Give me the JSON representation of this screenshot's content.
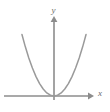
{
  "figure": {
    "name": "parabola-graph",
    "background_color": "#ffffff",
    "axis_color": "#8c8c8c",
    "curve_color": "#9a9a9a",
    "label_color": "#6b6b6b"
  },
  "chart_data": {
    "type": "line",
    "title": "",
    "subtitle": "",
    "xlabel": "x",
    "ylabel": "y",
    "equation": "y = x^2",
    "grid": false,
    "legend": null,
    "xlim": [
      -2.2,
      2.2
    ],
    "ylim": [
      -0.35,
      4.6
    ],
    "xticks": [],
    "yticks": [],
    "xticklabels": [],
    "yticklabels": [],
    "annotations": [],
    "series": [
      {
        "name": "y = x^2",
        "x": [
          -1.78,
          -1.6,
          -1.4,
          -1.2,
          -1.0,
          -0.8,
          -0.6,
          -0.4,
          -0.2,
          0.0,
          0.2,
          0.4,
          0.6,
          0.8,
          1.0,
          1.2,
          1.4,
          1.6,
          1.78
        ],
        "values": [
          3.17,
          2.56,
          1.96,
          1.44,
          1.0,
          0.64,
          0.36,
          0.16,
          0.04,
          0.0,
          0.04,
          0.16,
          0.36,
          0.64,
          1.0,
          1.44,
          1.96,
          2.56,
          3.17
        ]
      }
    ],
    "vertex": {
      "x": 0,
      "y": 0
    },
    "axes": {
      "x_axis_arrow": "right",
      "y_axis_arrow": "up",
      "origin_label": ""
    }
  },
  "labels": {
    "x_axis": "x",
    "y_axis": "y"
  }
}
